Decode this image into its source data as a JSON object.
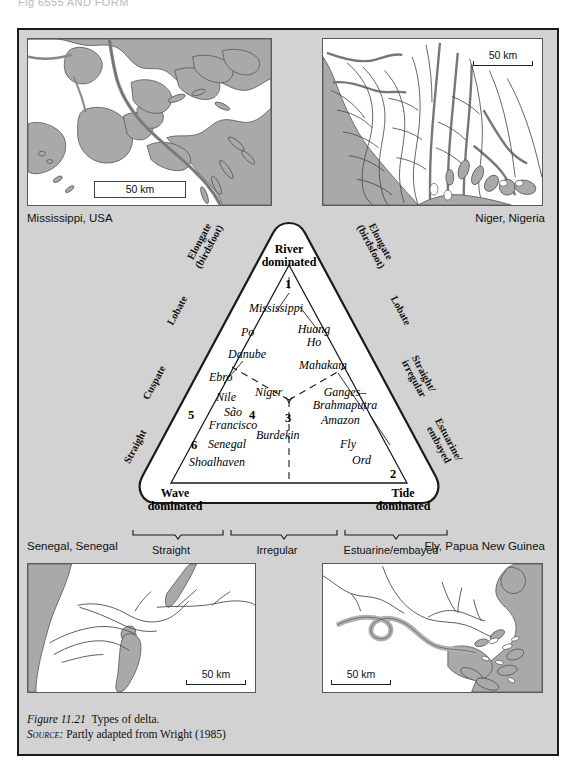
{
  "page": {
    "cut_header_text": "Fig 6555 AND FORM"
  },
  "figure": {
    "caption_label": "Figure 11.21",
    "caption_text": "Types of delta.",
    "source_label": "Source:",
    "source_text": "Partly adapted from Wright (1985)"
  },
  "maps": [
    {
      "id": "mississippi",
      "caption": "Mississippi,  USA",
      "scale": "50 km"
    },
    {
      "id": "niger",
      "caption": "Niger, Nigeria",
      "scale": "50 km"
    },
    {
      "id": "senegal",
      "caption": "Senegal, Senegal",
      "scale": "50 km"
    },
    {
      "id": "fly",
      "caption": "Fly, Papua New Guinea",
      "scale": "50 km"
    }
  ],
  "triangle": {
    "apex_label_line1": "River",
    "apex_label_line2": "dominated",
    "left_corner_line1": "Wave",
    "left_corner_line2": "dominated",
    "right_corner_line1": "Tide",
    "right_corner_line2": "dominated",
    "numbers": {
      "n1": "1",
      "n2": "2",
      "n3": "3",
      "n4": "4",
      "n5": "5",
      "n6": "6"
    },
    "deltas": {
      "mississippi": "Mississippi",
      "po": "Po",
      "huang_ho_line1": "Huang",
      "huang_ho_line2": "Ho",
      "danube": "Danube",
      "mahakam": "Mahakam",
      "ebro": "Ebro",
      "nile": "Nile",
      "niger": "Niger",
      "ganges_line1": "Ganges–",
      "ganges_line2": "Brahmaputra",
      "amazon": "Amazon",
      "sao_francisco_line1": "São",
      "sao_francisco_line2": "Francisco",
      "burdekin": "Burdekin",
      "senegal": "Senegal",
      "shoalhaven": "Shoalhaven",
      "fly": "Fly",
      "ord": "Ord"
    },
    "left_axis_tags": [
      {
        "line1": "Elongate",
        "line2": "(birdsfoot)"
      },
      {
        "line1": "Lobate",
        "line2": ""
      },
      {
        "line1": "Cuspate",
        "line2": ""
      },
      {
        "line1": "Straight",
        "line2": ""
      }
    ],
    "right_axis_tags": [
      {
        "line1": "Elongate",
        "line2": "(birdsfoot)"
      },
      {
        "line1": "Lobate",
        "line2": ""
      },
      {
        "line1": "Straight/",
        "line2": "irregular"
      },
      {
        "line1": "Estuarine/",
        "line2": "embayed"
      }
    ],
    "bottom_classes": [
      "Straight",
      "Irregular",
      "Estuarine/embayed"
    ]
  },
  "colors": {
    "panel_background": "#d2d2d2",
    "map_land_gray": "#a9a9a9",
    "map_white": "#ffffff",
    "outline": "#555555",
    "border": "#1a1a1a"
  }
}
